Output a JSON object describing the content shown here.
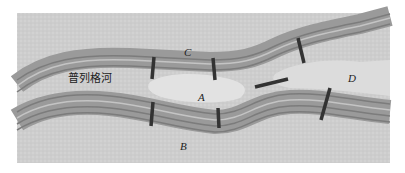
{
  "diagram": {
    "river_label": "普列格河",
    "regions": [
      {
        "id": "A",
        "label": "A",
        "x": 198,
        "y": 101
      },
      {
        "id": "B",
        "label": "B",
        "x": 180,
        "y": 148
      },
      {
        "id": "C",
        "label": "C",
        "x": 184,
        "y": 56
      },
      {
        "id": "D",
        "label": "D",
        "x": 350,
        "y": 82
      }
    ],
    "bridge_count": 7,
    "colors": {
      "panel": "#cfcfcf",
      "river_band": "#8a8a8a",
      "river_light": "#bdbdbd",
      "island": "#e2e2e2",
      "bridge": "#333333"
    }
  }
}
